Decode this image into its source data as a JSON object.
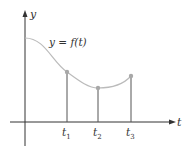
{
  "figure": {
    "y_axis_label": "y",
    "x_axis_label": "t",
    "curve_label": "y = f(t)",
    "ticks": [
      {
        "label": "t",
        "sub": "1"
      },
      {
        "label": "t",
        "sub": "2"
      },
      {
        "label": "t",
        "sub": "3"
      }
    ],
    "colors": {
      "axis": "#333333",
      "curve": "#b8b8b8",
      "points": "#a8a8a8",
      "verticals": "#555555"
    }
  }
}
